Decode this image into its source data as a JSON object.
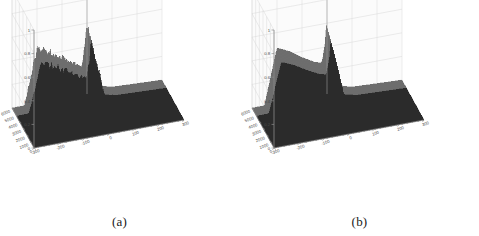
{
  "figure": {
    "background_color": "#ffffff",
    "panels": [
      {
        "id": "a",
        "caption": "(a)",
        "surface_style": "noisy",
        "surface_color": "#2b2b2b",
        "ridge_color": "#6e6e6e",
        "axis_color": "#8c8c8c",
        "grid_color": "#d8d8d8",
        "wall_color": "#fbfbfb"
      },
      {
        "id": "b",
        "caption": "(b)",
        "surface_style": "smooth",
        "surface_color": "#2b2b2b",
        "ridge_color": "#6e6e6e",
        "axis_color": "#8c8c8c",
        "grid_color": "#d8d8d8",
        "wall_color": "#fbfbfb"
      }
    ]
  },
  "chart_data": [
    {
      "type": "surface",
      "panel": "a",
      "title": "",
      "subtitle": "",
      "caption": "(a)",
      "xlabel": "",
      "ylabel": "",
      "zlabel": "",
      "xlim": [
        -300,
        300
      ],
      "ylim": [
        0,
        6000
      ],
      "zlim": [
        0,
        1
      ],
      "xticks": [
        -300,
        -200,
        -100,
        0,
        100,
        200,
        300
      ],
      "xticklabels": [
        "-300",
        "-200",
        "-100",
        "0",
        "100",
        "200",
        "300"
      ],
      "yticks": [
        0,
        1000,
        2000,
        3000,
        4000,
        5000,
        6000
      ],
      "yticklabels": [
        "0",
        "1000",
        "2000",
        "3000",
        "4000",
        "5000",
        "6000"
      ],
      "zticks": [
        0,
        0.2,
        0.4,
        0.6,
        0.8,
        1
      ],
      "zticklabels": [
        "0",
        "0.2",
        "0.4",
        "0.6",
        "0.8",
        "1"
      ],
      "grid": true,
      "legend": null,
      "view": "3d-azimuth-elevation",
      "description": "Noisy 3D surface: a jagged ridge rising along the left edge near x=-200, decaying toward the centre, with a sharp narrow spike at x=0 peaking near z=0.7; surface is dark and rough with high-frequency noise across the ridge crest.",
      "ridge_profile_x": [
        -300,
        -250,
        -200,
        -150,
        -100,
        -50,
        -20,
        -5,
        0,
        5,
        20,
        50,
        100,
        200,
        300
      ],
      "ridge_profile_z": [
        0.0,
        0.0,
        0.45,
        0.4,
        0.33,
        0.26,
        0.24,
        0.45,
        0.7,
        0.3,
        0.12,
        0.05,
        0.02,
        0.01,
        0.0
      ],
      "spike": {
        "x": 0,
        "z": 0.7
      },
      "ridge_plateau_z": 0.45,
      "noise_amplitude": 0.05
    },
    {
      "type": "surface",
      "panel": "b",
      "title": "",
      "subtitle": "",
      "caption": "(b)",
      "xlabel": "",
      "ylabel": "",
      "zlabel": "",
      "xlim": [
        -300,
        300
      ],
      "ylim": [
        0,
        6000
      ],
      "zlim": [
        0,
        1
      ],
      "xticks": [
        -300,
        -200,
        -100,
        0,
        100,
        200,
        300
      ],
      "xticklabels": [
        "-300",
        "-200",
        "-100",
        "0",
        "100",
        "200",
        "300"
      ],
      "yticks": [
        0,
        1000,
        2000,
        3000,
        4000,
        5000,
        6000
      ],
      "yticklabels": [
        "0",
        "1000",
        "2000",
        "3000",
        "4000",
        "5000",
        "6000"
      ],
      "zticks": [
        0,
        0.2,
        0.4,
        0.6,
        0.8,
        1
      ],
      "zticklabels": [
        "0",
        "0.2",
        "0.4",
        "0.6",
        "0.8",
        "1"
      ],
      "grid": true,
      "legend": null,
      "view": "3d-azimuth-elevation",
      "description": "Smooth 3D surface: a clean ridge rising along the left edge near x=-200, decaying smoothly toward the centre, with a sharp narrow spike at x=0 peaking near z=0.7; surface is dark with a smooth grey crest and no visible noise.",
      "ridge_profile_x": [
        -300,
        -250,
        -200,
        -150,
        -100,
        -50,
        -20,
        -5,
        0,
        5,
        20,
        50,
        100,
        200,
        300
      ],
      "ridge_profile_z": [
        0.0,
        0.0,
        0.47,
        0.42,
        0.35,
        0.29,
        0.27,
        0.47,
        0.7,
        0.3,
        0.12,
        0.05,
        0.02,
        0.01,
        0.0
      ],
      "spike": {
        "x": 0,
        "z": 0.7
      },
      "ridge_plateau_z": 0.47,
      "noise_amplitude": 0.0
    }
  ]
}
